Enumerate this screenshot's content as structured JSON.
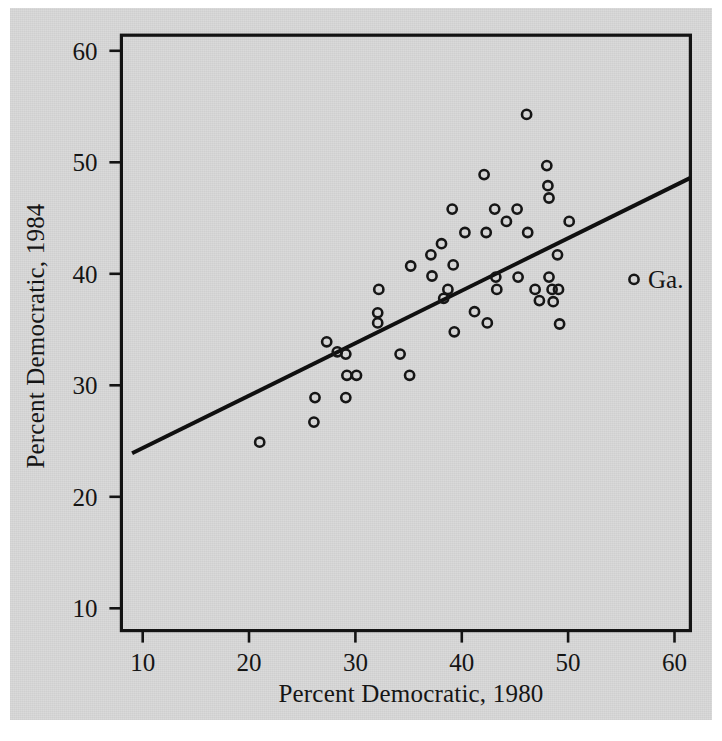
{
  "figure": {
    "background_color": "#d9d9d9",
    "page_color": "#ffffff",
    "ink_color": "#141414"
  },
  "axes": {
    "x_title": "Percent Democratic, 1980",
    "y_title": "Percent Democratic, 1984",
    "x_ticks": [
      "10",
      "20",
      "30",
      "40",
      "50",
      "60"
    ],
    "y_ticks": [
      "10",
      "20",
      "30",
      "40",
      "50",
      "60"
    ]
  },
  "annotations": [
    {
      "label": "Ga.",
      "x": 56.2,
      "y": 39.5
    }
  ],
  "chart_data": {
    "type": "scatter",
    "title": "",
    "xlabel": "Percent Democratic, 1980",
    "ylabel": "Percent Democratic, 1984",
    "xlim": [
      8.0,
      61.5
    ],
    "ylim": [
      8.0,
      61.4
    ],
    "xticks": [
      10,
      20,
      30,
      40,
      50,
      60
    ],
    "yticks": [
      10,
      20,
      30,
      40,
      50,
      60
    ],
    "grid": false,
    "legend": "none",
    "marker": "open-circle",
    "series": [
      {
        "name": "States, Percent Democratic 1980 vs 1984",
        "points": [
          {
            "x": 21.0,
            "y": 24.9
          },
          {
            "x": 26.1,
            "y": 26.7
          },
          {
            "x": 26.2,
            "y": 28.9
          },
          {
            "x": 27.3,
            "y": 33.9
          },
          {
            "x": 28.3,
            "y": 33.0
          },
          {
            "x": 29.1,
            "y": 32.8
          },
          {
            "x": 29.1,
            "y": 28.9
          },
          {
            "x": 29.2,
            "y": 30.9
          },
          {
            "x": 30.1,
            "y": 30.9
          },
          {
            "x": 32.1,
            "y": 36.5
          },
          {
            "x": 32.1,
            "y": 35.6
          },
          {
            "x": 32.2,
            "y": 38.6
          },
          {
            "x": 34.2,
            "y": 32.8
          },
          {
            "x": 35.1,
            "y": 30.9
          },
          {
            "x": 35.2,
            "y": 40.7
          },
          {
            "x": 37.1,
            "y": 41.7
          },
          {
            "x": 37.2,
            "y": 39.8
          },
          {
            "x": 38.1,
            "y": 42.7
          },
          {
            "x": 38.3,
            "y": 37.8
          },
          {
            "x": 38.7,
            "y": 38.6
          },
          {
            "x": 39.1,
            "y": 45.8
          },
          {
            "x": 39.2,
            "y": 40.8
          },
          {
            "x": 39.3,
            "y": 34.8
          },
          {
            "x": 40.3,
            "y": 43.7
          },
          {
            "x": 41.2,
            "y": 36.6
          },
          {
            "x": 42.1,
            "y": 48.9
          },
          {
            "x": 42.3,
            "y": 43.7
          },
          {
            "x": 42.4,
            "y": 35.6
          },
          {
            "x": 43.1,
            "y": 45.8
          },
          {
            "x": 43.2,
            "y": 39.7
          },
          {
            "x": 43.3,
            "y": 38.6
          },
          {
            "x": 44.2,
            "y": 44.7
          },
          {
            "x": 45.2,
            "y": 45.8
          },
          {
            "x": 45.3,
            "y": 39.7
          },
          {
            "x": 46.1,
            "y": 54.3
          },
          {
            "x": 46.2,
            "y": 43.7
          },
          {
            "x": 46.9,
            "y": 38.6
          },
          {
            "x": 47.3,
            "y": 37.6
          },
          {
            "x": 48.0,
            "y": 49.7
          },
          {
            "x": 48.1,
            "y": 47.9
          },
          {
            "x": 48.2,
            "y": 46.8
          },
          {
            "x": 48.2,
            "y": 39.7
          },
          {
            "x": 48.5,
            "y": 38.6
          },
          {
            "x": 48.6,
            "y": 37.5
          },
          {
            "x": 49.0,
            "y": 41.7
          },
          {
            "x": 49.1,
            "y": 38.6
          },
          {
            "x": 49.2,
            "y": 35.5
          },
          {
            "x": 50.1,
            "y": 44.7
          },
          {
            "x": 56.2,
            "y": 39.5
          }
        ]
      }
    ],
    "fit_line": {
      "name": "least-squares fit",
      "x_start": 9.0,
      "y_start": 23.9,
      "x_end": 61.5,
      "y_end": 48.6
    }
  }
}
